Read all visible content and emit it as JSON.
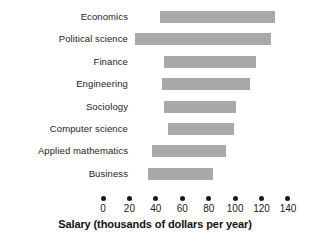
{
  "chart_data": {
    "type": "bar",
    "orientation": "horizontal",
    "title": "",
    "xlabel": "Salary (thousands of dollars per year)",
    "ylabel": "",
    "xlim": [
      0,
      140
    ],
    "xticks": [
      0,
      20,
      40,
      60,
      80,
      100,
      120,
      140
    ],
    "xtick_labels": [
      "0",
      "20",
      "40",
      "60",
      "80",
      "100",
      "120",
      "140"
    ],
    "grid": false,
    "legend": false,
    "note": "Bars are floating ranges (start and end values) per major",
    "categories": [
      "Economics",
      "Political science",
      "Finance",
      "Engineering",
      "Sociology",
      "Computer science",
      "Applied mathematics",
      "Business"
    ],
    "bar_starts": [
      43,
      24,
      46,
      45,
      46,
      49,
      37,
      34
    ],
    "bar_ends": [
      130,
      127,
      116,
      111,
      101,
      99,
      93,
      83
    ],
    "values": [
      87,
      103,
      70,
      66,
      55,
      50,
      56,
      49
    ],
    "bar_color": "#a9a9a9",
    "text_color": "#1a1a1a",
    "background_color": "#ffffff"
  }
}
